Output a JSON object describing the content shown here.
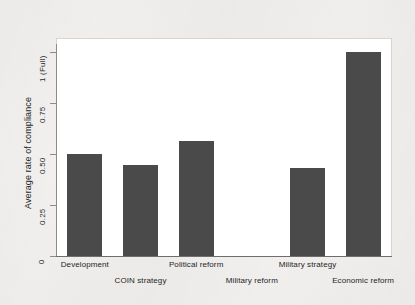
{
  "chart_data": {
    "type": "bar",
    "title": "",
    "subtitle": "",
    "xlabel": "",
    "ylabel": "Average rate of compliance",
    "categories": [
      "Development",
      "COIN strategy",
      "Political reform",
      "Military reform",
      "Military strategy",
      "Economic reform"
    ],
    "values": [
      0.5,
      0.445,
      0.565,
      0.0,
      0.43,
      1.0
    ],
    "ylim": [
      0,
      1
    ],
    "yticks": [
      0,
      0.25,
      0.5,
      0.75,
      1
    ],
    "ytick_labels": [
      "0",
      "0.25",
      "0.50",
      "0.75",
      "1 (Full)"
    ],
    "grid": false,
    "legend": "none",
    "bar_color": "#4a4a4a",
    "plot_background": "#ffffff",
    "page_background": "#f1f0ee",
    "axis_color": "#6e6e6e",
    "frame_color": "#d6d5d3"
  },
  "axis": {
    "y_title": "Average rate of compliance",
    "ticks": [
      {
        "label": "1 (Full)",
        "value": 1
      },
      {
        "label": "0.75",
        "value": 0.75
      },
      {
        "label": "0.50",
        "value": 0.5
      },
      {
        "label": "0.25",
        "value": 0.25
      },
      {
        "label": "0",
        "value": 0
      }
    ]
  },
  "x_labels": [
    {
      "text": "Development",
      "row": "top"
    },
    {
      "text": "COIN strategy",
      "row": "bot"
    },
    {
      "text": "Political reform",
      "row": "top"
    },
    {
      "text": "Military reform",
      "row": "bot"
    },
    {
      "text": "Military strategy",
      "row": "top"
    },
    {
      "text": "Economic reform",
      "row": "bot"
    }
  ]
}
